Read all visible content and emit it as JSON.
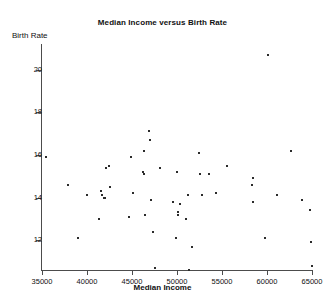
{
  "chart_data": {
    "type": "scatter",
    "title": "Median Income versus Birth Rate",
    "xlabel": "Median Income",
    "ylabel": "Birth Rate",
    "xlim": [
      35000,
      65000
    ],
    "ylim": [
      10.6,
      21.2
    ],
    "xticks": [
      35000,
      40000,
      45000,
      50000,
      55000,
      60000,
      65000
    ],
    "xtick_labels": [
      "35000",
      "40000",
      "45000",
      "50000",
      "55000",
      "60000",
      "65000"
    ],
    "yticks": [
      12,
      14,
      16,
      18,
      20
    ],
    "ytick_labels": [
      "12",
      "14",
      "16",
      "18",
      "20"
    ],
    "grid": false,
    "legend": false,
    "marker": "square",
    "marker_color": "#2b2b2b",
    "marker_size_px": 2,
    "points": [
      {
        "x": 35450,
        "y": 15.9
      },
      {
        "x": 37900,
        "y": 14.6
      },
      {
        "x": 39050,
        "y": 12.1
      },
      {
        "x": 39950,
        "y": 14.1
      },
      {
        "x": 41300,
        "y": 13.0
      },
      {
        "x": 41550,
        "y": 14.3
      },
      {
        "x": 41700,
        "y": 14.1
      },
      {
        "x": 41900,
        "y": 14.0
      },
      {
        "x": 42000,
        "y": 14.0
      },
      {
        "x": 42150,
        "y": 15.4
      },
      {
        "x": 42450,
        "y": 15.5
      },
      {
        "x": 42500,
        "y": 14.5
      },
      {
        "x": 44700,
        "y": 13.1
      },
      {
        "x": 44900,
        "y": 15.9
      },
      {
        "x": 45100,
        "y": 14.2
      },
      {
        "x": 46200,
        "y": 15.2
      },
      {
        "x": 46300,
        "y": 16.2
      },
      {
        "x": 46350,
        "y": 15.1
      },
      {
        "x": 46400,
        "y": 13.2
      },
      {
        "x": 46900,
        "y": 17.1
      },
      {
        "x": 47000,
        "y": 16.7
      },
      {
        "x": 47100,
        "y": 13.9
      },
      {
        "x": 47350,
        "y": 12.4
      },
      {
        "x": 47500,
        "y": 10.7
      },
      {
        "x": 48150,
        "y": 15.4
      },
      {
        "x": 49600,
        "y": 13.8
      },
      {
        "x": 49900,
        "y": 12.1
      },
      {
        "x": 50000,
        "y": 15.2
      },
      {
        "x": 50100,
        "y": 13.3
      },
      {
        "x": 50150,
        "y": 13.2
      },
      {
        "x": 50300,
        "y": 13.7
      },
      {
        "x": 51000,
        "y": 13.0
      },
      {
        "x": 51200,
        "y": 14.1
      },
      {
        "x": 51300,
        "y": 10.6
      },
      {
        "x": 51700,
        "y": 11.7
      },
      {
        "x": 52450,
        "y": 16.1
      },
      {
        "x": 52600,
        "y": 15.1
      },
      {
        "x": 52750,
        "y": 14.1
      },
      {
        "x": 53600,
        "y": 15.1
      },
      {
        "x": 54300,
        "y": 14.2
      },
      {
        "x": 55500,
        "y": 15.5
      },
      {
        "x": 58300,
        "y": 14.6
      },
      {
        "x": 58400,
        "y": 14.9
      },
      {
        "x": 58450,
        "y": 13.8
      },
      {
        "x": 59800,
        "y": 12.1
      },
      {
        "x": 60150,
        "y": 20.7
      },
      {
        "x": 61100,
        "y": 14.1
      },
      {
        "x": 62700,
        "y": 16.2
      },
      {
        "x": 63900,
        "y": 13.9
      },
      {
        "x": 64800,
        "y": 13.4
      },
      {
        "x": 64900,
        "y": 11.9
      },
      {
        "x": 64950,
        "y": 10.8
      }
    ]
  }
}
